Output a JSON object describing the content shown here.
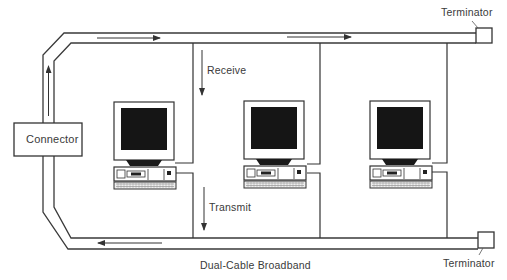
{
  "diagram": {
    "title": "Dual-Cable Broadband",
    "labels": {
      "connector": "Connector",
      "terminator_top": "Terminator",
      "terminator_bottom": "Terminator",
      "receive": "Receive",
      "transmit": "Transmit"
    },
    "nodes": [
      {
        "id": "computer-1",
        "type": "desktop-computer"
      },
      {
        "id": "computer-2",
        "type": "desktop-computer"
      },
      {
        "id": "computer-3",
        "type": "desktop-computer"
      }
    ],
    "cables": {
      "receive_cable": "top cable, signal flows left to right",
      "transmit_cable": "bottom cable, signal flows right to left"
    },
    "colors": {
      "line": "#3a3a3a",
      "screen": "#111111",
      "background": "#ffffff"
    }
  }
}
